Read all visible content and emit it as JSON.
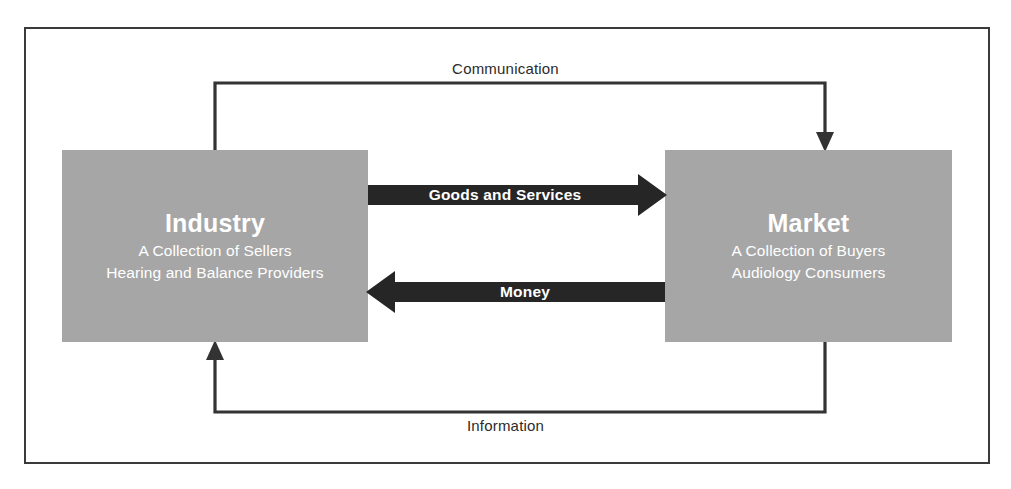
{
  "diagram": {
    "colors": {
      "box_fill": "#a6a6a6",
      "box_text": "#ffffff",
      "arrow_fill": "#262626",
      "frame_border": "#3a3a3a",
      "connector_stroke": "#333333",
      "background": "#ffffff"
    },
    "entities": [
      {
        "id": "industry",
        "title": "Industry",
        "sub1": "A Collection of Sellers",
        "sub2": "Hearing and Balance Providers"
      },
      {
        "id": "market",
        "title": "Market",
        "sub1": "A Collection of Buyers",
        "sub2": "Audiology Consumers"
      }
    ],
    "flows": [
      {
        "id": "communication",
        "label": "Communication",
        "from": "industry",
        "to": "market",
        "style": "thin-line",
        "direction": "right"
      },
      {
        "id": "goods-and-services",
        "label": "Goods and Services",
        "from": "industry",
        "to": "market",
        "style": "block-arrow",
        "direction": "right"
      },
      {
        "id": "money",
        "label": "Money",
        "from": "market",
        "to": "industry",
        "style": "block-arrow",
        "direction": "left"
      },
      {
        "id": "information",
        "label": "Information",
        "from": "market",
        "to": "industry",
        "style": "thin-line",
        "direction": "left"
      }
    ]
  }
}
